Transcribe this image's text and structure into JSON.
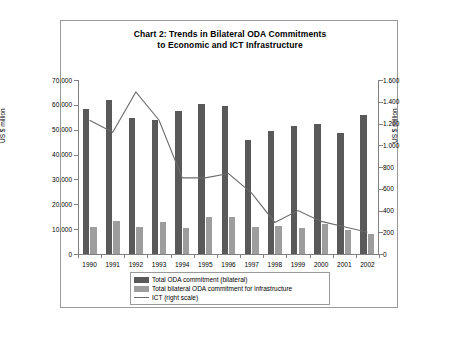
{
  "chart_data": {
    "type": "bar",
    "title": "Chart 2: Trends in Bilateral ODA Commitments to Economic and ICT Infrastructure",
    "title_line1": "Chart 2: Trends in Bilateral ODA Commitments",
    "title_line2": "to Economic and ICT Infrastructure",
    "xlabel": "",
    "ylabel": "US $ million",
    "ylabel_right": "US $ million",
    "categories": [
      "1990",
      "1991",
      "1992",
      "1993",
      "1994",
      "1995",
      "1996",
      "1997",
      "1998",
      "1999",
      "2000",
      "2001",
      "2002"
    ],
    "ylim": [
      0,
      70000
    ],
    "ylim_right": [
      0,
      1600
    ],
    "yticks": [
      0,
      10000,
      20000,
      30000,
      40000,
      50000,
      60000,
      70000
    ],
    "ytick_labels": [
      "0",
      "10.000",
      "20.000",
      "30.000",
      "40.000",
      "50.000",
      "60.000",
      "70.000"
    ],
    "yticks_right": [
      0,
      200,
      400,
      600,
      800,
      1000,
      1200,
      1400,
      1600
    ],
    "ytick_labels_right": [
      "0",
      "200",
      "400",
      "600",
      "800",
      "1.000",
      "1.200",
      "1.400",
      "1.600"
    ],
    "grid": false,
    "legend_position": "bottom",
    "series": [
      {
        "name": "Total ODA commitment (bilateral)",
        "type": "bar",
        "axis": "left",
        "color": "#595959",
        "values": [
          58500,
          62000,
          54800,
          54000,
          57500,
          60500,
          59700,
          46000,
          49500,
          51500,
          52500,
          48800,
          56000
        ]
      },
      {
        "name": "Total bilateral ODA commitment for infrastructure",
        "type": "bar",
        "axis": "left",
        "color": "#9d9d9d",
        "values": [
          10700,
          13100,
          10900,
          12900,
          10500,
          14700,
          14800,
          10900,
          11300,
          10300,
          12100,
          9600,
          8200
        ]
      },
      {
        "name": "ICT (right scale)",
        "type": "line",
        "axis": "right",
        "color": "#6b6b6b",
        "values": [
          1230,
          1120,
          1490,
          1230,
          700,
          700,
          740,
          560,
          290,
          400,
          300,
          250,
          200
        ]
      }
    ]
  },
  "legend": {
    "items": [
      {
        "label": "Total ODA commitment (bilateral)",
        "swatch": "dark"
      },
      {
        "label": "Total bilateral ODA commitment for infrastructure",
        "swatch": "light"
      },
      {
        "label": "ICT (right scale)",
        "swatch": "line"
      }
    ]
  }
}
